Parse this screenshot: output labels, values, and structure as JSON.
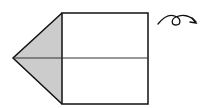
{
  "diagram": {
    "type": "origami-step",
    "colors": {
      "stroke": "#111111",
      "paper_front": "#ffffff",
      "paper_back": "#cccccc",
      "background": "#ffffff"
    },
    "shapes": {
      "square": {
        "x": 62,
        "y": 13,
        "w": 86,
        "h": 91
      },
      "left_flap_point": {
        "x": 13,
        "y": 58
      },
      "midline_y": 58
    },
    "symbols": [
      {
        "name": "turn-over-arrow",
        "meaning": "turn the model over"
      }
    ]
  }
}
